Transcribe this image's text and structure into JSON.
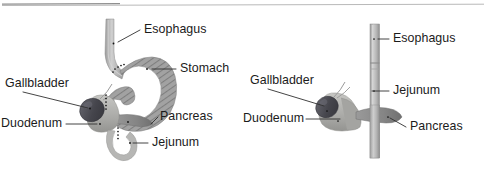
{
  "figure": {
    "background_color": "#ffffff",
    "text_color": "#1b1b1b",
    "leader_color": "#303030",
    "rule_color": "#b9b9b9",
    "width": 486,
    "height": 177
  },
  "top_rule": {
    "present": true,
    "y": 5,
    "x_start": 2,
    "x_end": 484
  },
  "panels": [
    {
      "id": "left-panel",
      "name": "normal-anatomy-panel",
      "description": "Normal stomach anatomy with curved esophagus, hatched stomach, gallbladder, duodenum, pancreas and jejunum",
      "organs": {
        "esophagus_fill": "#b5b5b5",
        "stomach_fill": "#9c9c9c",
        "stomach_hatch": "#7a7a7a",
        "gallbladder_fill": "#4c4c52",
        "duodenum_fill": "#b0b0ae",
        "pancreas_fill": "#8e8e8e",
        "jejunum_fill": "#b3b3b1"
      },
      "labels": [
        {
          "id": "esophagus",
          "text": "Esophagus",
          "x": 144,
          "y": 30,
          "anchor": "start",
          "tick_x": 112,
          "tick_y": 42
        },
        {
          "id": "stomach",
          "text": "Stomach",
          "x": 180,
          "y": 69,
          "anchor": "start",
          "tick_x": 148,
          "tick_y": 69
        },
        {
          "id": "gallbladder",
          "text": "Gallbladder",
          "x": 5,
          "y": 84,
          "anchor": "start",
          "tick_x": 84,
          "tick_y": 106
        },
        {
          "id": "duodenum",
          "text": "Duodenum",
          "x": 1,
          "y": 124,
          "anchor": "start",
          "tick_x": 94,
          "tick_y": 124
        },
        {
          "id": "pancreas",
          "text": "Pancreas",
          "x": 160,
          "y": 117,
          "anchor": "start",
          "tick_x": 122,
          "tick_y": 124
        },
        {
          "id": "jejunum",
          "text": "Jejunum",
          "x": 152,
          "y": 143,
          "anchor": "start",
          "tick_x": 131,
          "tick_y": 143
        }
      ]
    },
    {
      "id": "right-panel",
      "name": "post-surgical-anatomy-panel",
      "description": "Post gastrectomy anatomy with straight vertical conduit, gallbladder, duodenum, jejunum and pancreas",
      "organs": {
        "conduit_fill": "#bdbdbd",
        "gallbladder_fill": "#4c4c52",
        "duodenum_fill": "#b0b0ae",
        "pancreas_fill": "#8e8e8e"
      },
      "labels": [
        {
          "id": "esophagus",
          "text": "Esophagus",
          "x": 393,
          "y": 39,
          "anchor": "start",
          "tick_x": 381,
          "tick_y": 39
        },
        {
          "id": "gallbladder",
          "text": "Gallbladder",
          "x": 250,
          "y": 81,
          "anchor": "start",
          "tick_x": 322,
          "tick_y": 104
        },
        {
          "id": "jejunum",
          "text": "Jejunum",
          "x": 393,
          "y": 91,
          "anchor": "start",
          "tick_x": 381,
          "tick_y": 91
        },
        {
          "id": "duodenum",
          "text": "Duodenum",
          "x": 243,
          "y": 119,
          "anchor": "start",
          "tick_x": 338,
          "tick_y": 119
        },
        {
          "id": "pancreas",
          "text": "Pancreas",
          "x": 410,
          "y": 127,
          "anchor": "start",
          "tick_x": 386,
          "tick_y": 127
        }
      ]
    }
  ]
}
